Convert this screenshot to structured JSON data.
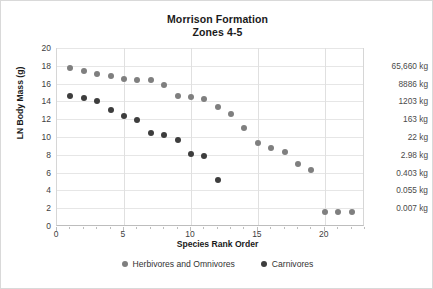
{
  "chart_data": {
    "type": "scatter",
    "title": "Morrison Formation",
    "subtitle": "Zones 4-5",
    "xlabel": "Species Rank Order",
    "ylabel": "LN Body Mass (g)",
    "xlim": [
      0,
      23
    ],
    "ylim": [
      0,
      20
    ],
    "grid": true,
    "legend_position": "bottom",
    "xticks": [
      0,
      5,
      10,
      15,
      20
    ],
    "yticks": [
      0,
      2,
      4,
      6,
      8,
      10,
      12,
      14,
      16,
      18,
      20
    ],
    "secondary_axis": {
      "label_suffix": "kg",
      "entries": [
        {
          "ln_value": 18,
          "label": "65,660 kg"
        },
        {
          "ln_value": 16,
          "label": "8886 kg"
        },
        {
          "ln_value": 14,
          "label": "1203 kg"
        },
        {
          "ln_value": 12,
          "label": "163 kg"
        },
        {
          "ln_value": 10,
          "label": "22 kg"
        },
        {
          "ln_value": 8,
          "label": "2.98 kg"
        },
        {
          "ln_value": 6,
          "label": "0.403 kg"
        },
        {
          "ln_value": 4,
          "label": "0.055 kg"
        },
        {
          "ln_value": 2,
          "label": "0.007 kg"
        }
      ]
    },
    "series": [
      {
        "name": "Herbivores and Omnivores",
        "color": "#7f7f7f",
        "points": [
          [
            1,
            17.7
          ],
          [
            2,
            17.4
          ],
          [
            3,
            17.1
          ],
          [
            4,
            16.9
          ],
          [
            5,
            16.5
          ],
          [
            6,
            16.4
          ],
          [
            7,
            16.4
          ],
          [
            8,
            15.8
          ],
          [
            9,
            14.6
          ],
          [
            10,
            14.5
          ],
          [
            11,
            14.3
          ],
          [
            12,
            13.4
          ],
          [
            13,
            12.6
          ],
          [
            14,
            11.0
          ],
          [
            15,
            9.3
          ],
          [
            16,
            8.8
          ],
          [
            17,
            8.3
          ],
          [
            18,
            7.0
          ],
          [
            19,
            6.3
          ],
          [
            20,
            1.6
          ],
          [
            21,
            1.6
          ],
          [
            22,
            1.6
          ]
        ]
      },
      {
        "name": "Carnivores",
        "color": "#3d3d3d",
        "points": [
          [
            1,
            14.6
          ],
          [
            2,
            14.4
          ],
          [
            3,
            14.1
          ],
          [
            4,
            13.0
          ],
          [
            5,
            12.4
          ],
          [
            6,
            11.9
          ],
          [
            7,
            10.5
          ],
          [
            8,
            10.2
          ],
          [
            9,
            9.7
          ],
          [
            10,
            8.1
          ],
          [
            11,
            7.9
          ],
          [
            12,
            5.2
          ]
        ]
      }
    ]
  },
  "legend": {
    "items": [
      {
        "label": "Herbivores and Omnivores",
        "color": "#7f7f7f"
      },
      {
        "label": "Carnivores",
        "color": "#3d3d3d"
      }
    ]
  }
}
